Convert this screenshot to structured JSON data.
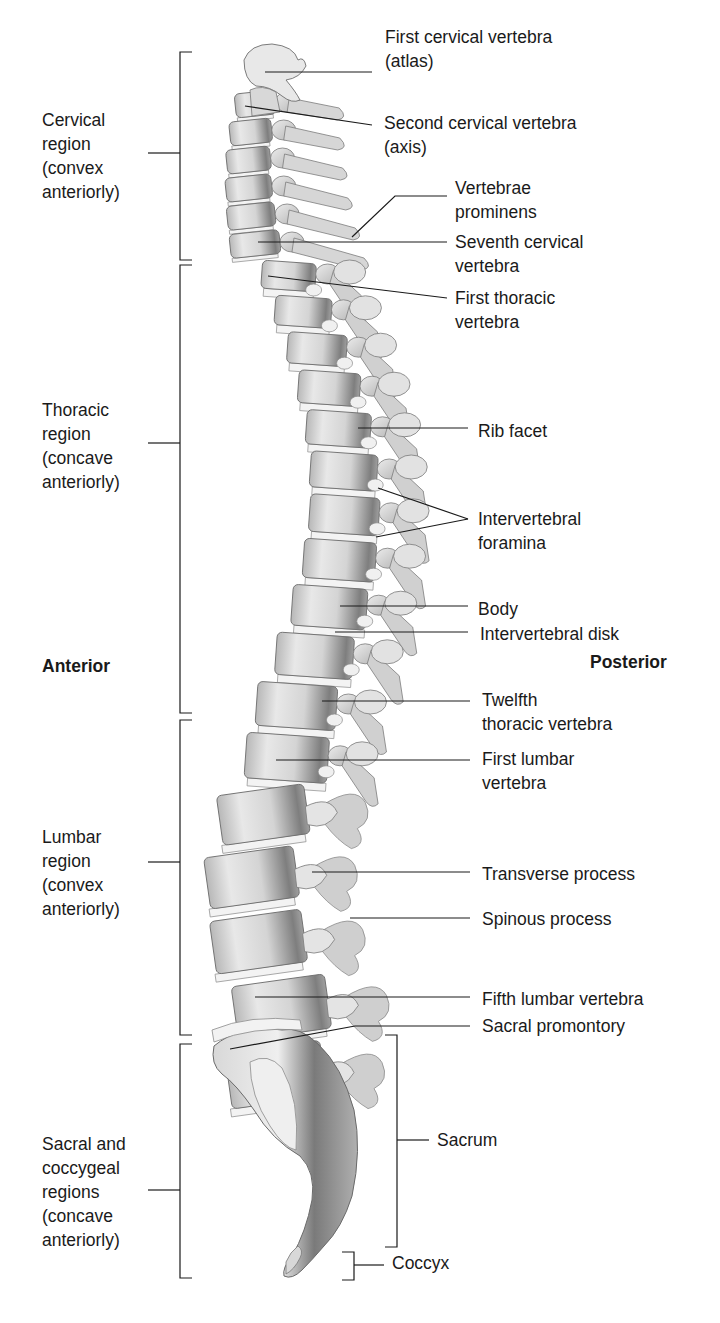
{
  "figure": {
    "orientation": {
      "anterior": {
        "text": "Anterior",
        "x": 42,
        "y": 654
      },
      "posterior": {
        "text": "Posterior",
        "x": 590,
        "y": 650
      }
    }
  },
  "regions": [
    {
      "id": "cervical",
      "text": "Cervical\nregion\n(convex\nanteriorly)",
      "x": 42,
      "y": 108,
      "bracket": {
        "x": 180,
        "top": 52,
        "bottom": 260,
        "tick_y": 153
      }
    },
    {
      "id": "thoracic",
      "text": "Thoracic\nregion\n(concave\nanteriorly)",
      "x": 42,
      "y": 398,
      "bracket": {
        "x": 180,
        "top": 265,
        "bottom": 713,
        "tick_y": 443
      }
    },
    {
      "id": "lumbar",
      "text": "Lumbar\nregion\n(convex\nanteriorly)",
      "x": 42,
      "y": 825,
      "bracket": {
        "x": 180,
        "top": 720,
        "bottom": 1035,
        "tick_y": 862
      }
    },
    {
      "id": "sacral-coccygeal",
      "text": "Sacral and\ncoccygeal\nregions\n(concave\nanteriorly)",
      "x": 42,
      "y": 1132,
      "bracket": {
        "x": 180,
        "top": 1044,
        "bottom": 1278,
        "tick_y": 1190
      }
    }
  ],
  "labels": [
    {
      "id": "first-cervical",
      "text": "First cervical vertebra\n(atlas)",
      "x": 385,
      "y": 25,
      "line": [
        [
          265,
          72
        ],
        [
          372,
          72
        ]
      ]
    },
    {
      "id": "second-cervical",
      "text": "Second cervical vertebra\n(axis)",
      "x": 384,
      "y": 111,
      "line": [
        [
          245,
          106
        ],
        [
          372,
          125
        ]
      ]
    },
    {
      "id": "vertebrae-prominens",
      "text": "Vertebrae\nprominens",
      "x": 455,
      "y": 176,
      "line": [
        [
          352,
          237
        ],
        [
          395,
          196
        ],
        [
          447,
          196
        ]
      ]
    },
    {
      "id": "seventh-cervical",
      "text": "Seventh cervical\nvertebra",
      "x": 455,
      "y": 230,
      "line": [
        [
          258,
          242
        ],
        [
          447,
          242
        ]
      ]
    },
    {
      "id": "first-thoracic",
      "text": "First thoracic\nvertebra",
      "x": 455,
      "y": 286,
      "line": [
        [
          268,
          276
        ],
        [
          447,
          298
        ]
      ]
    },
    {
      "id": "rib-facet",
      "text": "Rib facet",
      "x": 478,
      "y": 419,
      "line": [
        [
          358,
          428
        ],
        [
          468,
          428
        ]
      ]
    },
    {
      "id": "intervertebral-foramina",
      "text": "Intervertebral\nforamina",
      "x": 478,
      "y": 507,
      "lines": [
        [
          [
            378,
            488
          ],
          [
            468,
            519
          ]
        ],
        [
          [
            376,
            537
          ],
          [
            468,
            519
          ]
        ]
      ]
    },
    {
      "id": "body",
      "text": "Body",
      "x": 478,
      "y": 597,
      "line": [
        [
          340,
          606
        ],
        [
          468,
          606
        ]
      ]
    },
    {
      "id": "intervertebral-disk",
      "text": "Intervertebral disk",
      "x": 480,
      "y": 622,
      "line": [
        [
          335,
          632
        ],
        [
          468,
          632
        ]
      ]
    },
    {
      "id": "twelfth-thoracic",
      "text": "Twelfth\nthoracic vertebra",
      "x": 482,
      "y": 688,
      "line": [
        [
          322,
          701
        ],
        [
          470,
          701
        ]
      ]
    },
    {
      "id": "first-lumbar",
      "text": "First lumbar\nvertebra",
      "x": 482,
      "y": 747,
      "line": [
        [
          276,
          760
        ],
        [
          470,
          760
        ]
      ]
    },
    {
      "id": "transverse-process",
      "text": "Transverse process",
      "x": 482,
      "y": 862,
      "line": [
        [
          312,
          872
        ],
        [
          470,
          872
        ]
      ]
    },
    {
      "id": "spinous-process",
      "text": "Spinous process",
      "x": 482,
      "y": 907,
      "line": [
        [
          350,
          918
        ],
        [
          470,
          918
        ]
      ]
    },
    {
      "id": "fifth-lumbar",
      "text": "Fifth lumbar vertebra",
      "x": 482,
      "y": 987,
      "line": [
        [
          255,
          997
        ],
        [
          470,
          997
        ]
      ]
    },
    {
      "id": "sacral-promontory",
      "text": "Sacral promontory",
      "x": 482,
      "y": 1014,
      "line": [
        [
          230,
          1049
        ],
        [
          355,
          1026
        ],
        [
          470,
          1026
        ]
      ]
    },
    {
      "id": "sacrum",
      "text": "Sacrum",
      "x": 437,
      "y": 1128,
      "bracket": {
        "x": 397,
        "top": 1035,
        "bottom": 1247,
        "tick_y": 1140,
        "side": "right",
        "tick_len": 32
      }
    },
    {
      "id": "coccyx",
      "text": "Coccyx",
      "x": 392,
      "y": 1251,
      "bracket": {
        "x": 354,
        "top": 1252,
        "bottom": 1280,
        "tick_y": 1265,
        "side": "right",
        "tick_len": 30
      }
    }
  ],
  "colors": {
    "ink": "#1a1a1a",
    "bone_light": "#e6e6e6",
    "bone_mid": "#c4c4c4",
    "bone_dark": "#8a8a8a",
    "disk": "#f2f2f2",
    "process": "#d2d2d2"
  }
}
